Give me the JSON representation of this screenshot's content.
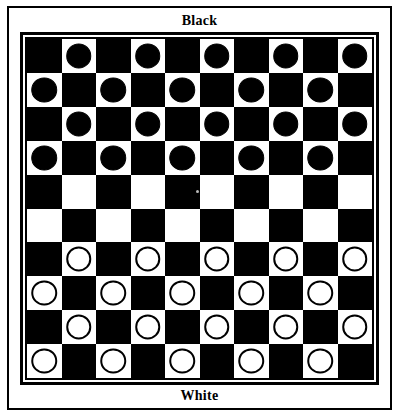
{
  "labels": {
    "top": "Black",
    "bottom": "White"
  },
  "colors": {
    "dark_square": "#000000",
    "light_square": "#ffffff",
    "black_piece": "#000000",
    "white_piece": "#ffffff",
    "piece_outline": "#000000",
    "frame": "#000000",
    "background": "#ffffff"
  },
  "board": {
    "variant": "international-draughts",
    "rows": 10,
    "columns": 10,
    "dark_square_rule": "(row + column) even",
    "piece_square_color": "light",
    "black_piece_count": 20,
    "white_piece_count": 20,
    "empty_rows": [
      4,
      5
    ],
    "cells": [
      [
        null,
        "black",
        null,
        "black",
        null,
        "black",
        null,
        "black",
        null,
        "black"
      ],
      [
        "black",
        null,
        "black",
        null,
        "black",
        null,
        "black",
        null,
        "black",
        null
      ],
      [
        null,
        "black",
        null,
        "black",
        null,
        "black",
        null,
        "black",
        null,
        "black"
      ],
      [
        "black",
        null,
        "black",
        null,
        "black",
        null,
        "black",
        null,
        "black",
        null
      ],
      [
        null,
        null,
        null,
        null,
        null,
        null,
        null,
        null,
        null,
        null
      ],
      [
        null,
        null,
        null,
        null,
        null,
        null,
        null,
        null,
        null,
        null
      ],
      [
        null,
        "white",
        null,
        "white",
        null,
        "white",
        null,
        "white",
        null,
        "white"
      ],
      [
        "white",
        null,
        "white",
        null,
        "white",
        null,
        "white",
        null,
        "white",
        null
      ],
      [
        null,
        "white",
        null,
        "white",
        null,
        "white",
        null,
        "white",
        null,
        "white"
      ],
      [
        "white",
        null,
        "white",
        null,
        "white",
        null,
        "white",
        null,
        "white",
        null
      ]
    ]
  }
}
